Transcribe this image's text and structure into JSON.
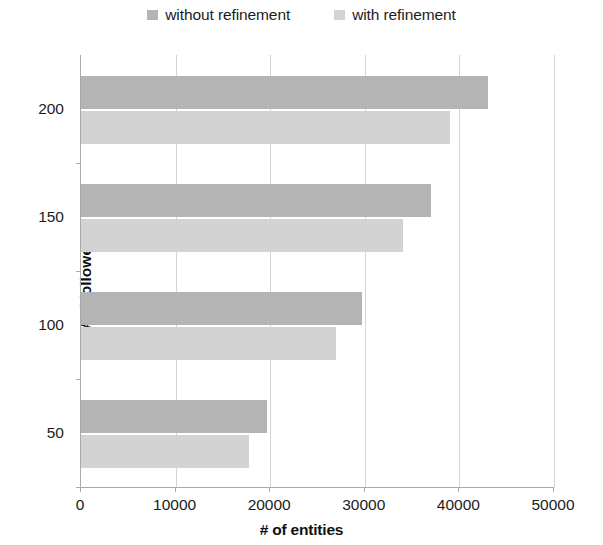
{
  "chart_data": {
    "type": "bar",
    "orientation": "horizontal",
    "title": "",
    "xlabel": "# of entities",
    "ylabel": "# of followees",
    "categories": [
      "200",
      "150",
      "100",
      "50"
    ],
    "series": [
      {
        "name": "without refinement",
        "color": "#b4b4b4",
        "values": [
          43000,
          37000,
          29700,
          19700
        ]
      },
      {
        "name": "with refinement",
        "color": "#d3d3d3",
        "values": [
          39000,
          34000,
          27000,
          17800
        ]
      }
    ],
    "xlim": [
      0,
      50000
    ],
    "xticks": [
      0,
      10000,
      20000,
      30000,
      40000,
      50000
    ],
    "xtick_labels": [
      "0",
      "10000",
      "20000",
      "30000",
      "40000",
      "50000"
    ],
    "grid": true,
    "grid_axis": "x",
    "legend_position": "top-center"
  },
  "legend": {
    "entries": [
      {
        "label": "without refinement",
        "swatch_name": "legend-swatch-without-refinement"
      },
      {
        "label": "with refinement",
        "swatch_name": "legend-swatch-with-refinement"
      }
    ]
  },
  "axes": {
    "x_title": "# of entities",
    "y_title": "# of followees",
    "x_tick_labels": [
      "0",
      "10000",
      "20000",
      "30000",
      "40000",
      "50000"
    ],
    "y_tick_labels": [
      "200",
      "150",
      "100",
      "50"
    ]
  }
}
